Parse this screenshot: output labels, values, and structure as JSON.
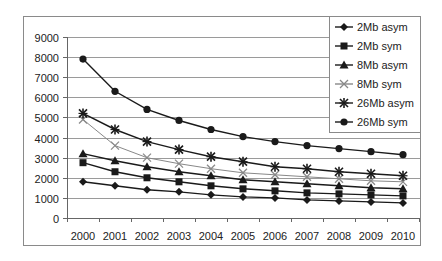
{
  "chart_data": {
    "type": "line",
    "title": "",
    "xlabel": "",
    "ylabel": "",
    "x": [
      "2000",
      "2001",
      "2002",
      "2003",
      "2004",
      "2005",
      "2006",
      "2007",
      "2008",
      "2009",
      "2010"
    ],
    "ylim": [
      0,
      9000
    ],
    "yticks": [
      0,
      1000,
      2000,
      3000,
      4000,
      5000,
      6000,
      7000,
      8000,
      9000
    ],
    "grid": "horizontal",
    "legend_position": "top-right",
    "series": [
      {
        "name": "2Mb asym",
        "marker": "diamond",
        "color": "#1a1a1a",
        "values": [
          1800,
          1600,
          1400,
          1300,
          1150,
          1050,
          1000,
          900,
          850,
          800,
          750
        ]
      },
      {
        "name": "2Mb sym",
        "marker": "square",
        "color": "#1a1a1a",
        "values": [
          2750,
          2300,
          2000,
          1800,
          1600,
          1450,
          1350,
          1250,
          1200,
          1150,
          1100
        ]
      },
      {
        "name": "8Mb asym",
        "marker": "triangle",
        "color": "#1a1a1a",
        "values": [
          3200,
          2850,
          2550,
          2300,
          2100,
          1900,
          1800,
          1700,
          1600,
          1500,
          1450
        ]
      },
      {
        "name": "8Mb sym",
        "marker": "x",
        "color": "#888888",
        "values": [
          4900,
          3600,
          3000,
          2700,
          2450,
          2250,
          2150,
          2050,
          1950,
          1850,
          1800
        ]
      },
      {
        "name": "26Mb asym",
        "marker": "asterisk",
        "color": "#1a1a1a",
        "values": [
          5200,
          4400,
          3800,
          3400,
          3050,
          2800,
          2550,
          2450,
          2300,
          2200,
          2100
        ]
      },
      {
        "name": "26Mb sym",
        "marker": "circle",
        "color": "#1a1a1a",
        "values": [
          7900,
          6300,
          5400,
          4850,
          4400,
          4050,
          3800,
          3600,
          3450,
          3300,
          3150
        ]
      }
    ]
  }
}
